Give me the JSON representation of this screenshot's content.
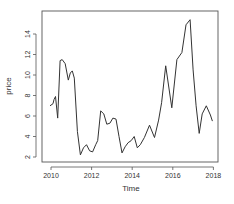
{
  "chart_data": {
    "type": "line",
    "title": "",
    "xlabel": "Time",
    "ylabel": "price",
    "xlim": [
      2009.8,
      2018.2
    ],
    "ylim": [
      1.5,
      16.2
    ],
    "x_ticks": [
      2010,
      2012,
      2014,
      2016,
      2018
    ],
    "y_ticks": [
      2,
      4,
      6,
      8,
      10,
      12,
      14
    ],
    "grid": false,
    "legend": null,
    "series": [
      {
        "name": "price",
        "color": "#333333",
        "x": [
          2009.95,
          2010.1,
          2010.15,
          2010.22,
          2010.33,
          2010.45,
          2010.55,
          2010.7,
          2010.85,
          2010.95,
          2011.05,
          2011.15,
          2011.3,
          2011.45,
          2011.6,
          2011.75,
          2011.9,
          2012.05,
          2012.2,
          2012.3,
          2012.45,
          2012.6,
          2012.75,
          2012.9,
          2013.05,
          2013.2,
          2013.35,
          2013.5,
          2013.65,
          2013.8,
          2013.95,
          2014.1,
          2014.25,
          2014.4,
          2014.6,
          2014.85,
          2015.1,
          2015.3,
          2015.45,
          2015.65,
          2015.95,
          2016.2,
          2016.45,
          2016.65,
          2016.85,
          2017.0,
          2017.15,
          2017.3,
          2017.45,
          2017.65,
          2017.85,
          2017.95
        ],
        "values": [
          7.0,
          7.2,
          7.6,
          7.9,
          5.8,
          11.4,
          11.5,
          11.1,
          9.5,
          10.2,
          10.4,
          9.7,
          4.5,
          2.2,
          2.9,
          3.2,
          2.6,
          2.5,
          3.2,
          3.6,
          6.5,
          6.2,
          5.2,
          5.3,
          5.8,
          5.7,
          4.0,
          2.4,
          3.0,
          3.4,
          3.6,
          4.0,
          2.9,
          3.2,
          3.9,
          5.1,
          3.9,
          5.6,
          7.3,
          10.9,
          6.8,
          11.5,
          12.2,
          14.9,
          15.4,
          10.5,
          7.0,
          4.3,
          6.2,
          7.0,
          6.1,
          5.5
        ]
      }
    ]
  }
}
